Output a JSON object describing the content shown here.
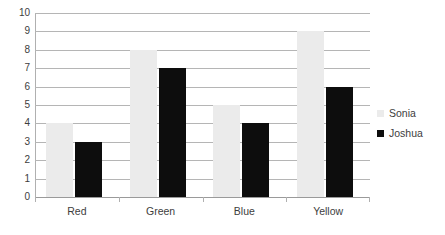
{
  "chart_data": {
    "type": "bar",
    "title": "",
    "xlabel": "",
    "ylabel": "",
    "ylim": [
      0,
      10
    ],
    "ytick_step": 1,
    "yticks": [
      "10",
      "9",
      "8",
      "7",
      "6",
      "5",
      "4",
      "3",
      "2",
      "1",
      "0"
    ],
    "grid": true,
    "legend_position": "right",
    "categories": [
      "Red",
      "Green",
      "Blue",
      "Yellow"
    ],
    "series": [
      {
        "name": "Sonia",
        "color": "#ebebeb",
        "values": [
          4,
          8,
          5,
          9
        ]
      },
      {
        "name": "Joshua",
        "color": "#0d0d0d",
        "values": [
          3,
          7,
          4,
          6
        ]
      }
    ]
  },
  "legend": {
    "items": [
      {
        "label": "Sonia",
        "swatch": "sonia-legend-swatch"
      },
      {
        "label": "Joshua",
        "swatch": "joshua-legend-swatch"
      }
    ]
  }
}
